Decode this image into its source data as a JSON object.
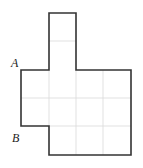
{
  "diagram": {
    "type": "grid-polygon",
    "grid_unit_px": 27.5,
    "colors": {
      "outline": "#333333",
      "grid": "#d9d9d9",
      "label": "#222222",
      "background": "#ffffff"
    },
    "labels": [
      {
        "id": "A",
        "text": "A",
        "x": 11,
        "y": 67
      },
      {
        "id": "B",
        "text": "B",
        "x": 12,
        "y": 142
      }
    ],
    "outline_points": "49,13 76,13 76,70 131,70 131,155 49,155 49,126 21,126 21,70 49,70",
    "grid_lines": [
      {
        "x1": 49,
        "y1": 41,
        "x2": 76,
        "y2": 41
      },
      {
        "x1": 21,
        "y1": 98,
        "x2": 131,
        "y2": 98
      },
      {
        "x1": 49,
        "y1": 126,
        "x2": 131,
        "y2": 126
      },
      {
        "x1": 49,
        "y1": 70,
        "x2": 49,
        "y2": 126
      },
      {
        "x1": 76,
        "y1": 70,
        "x2": 76,
        "y2": 155
      },
      {
        "x1": 103,
        "y1": 70,
        "x2": 103,
        "y2": 155
      }
    ]
  }
}
